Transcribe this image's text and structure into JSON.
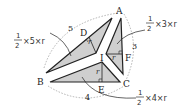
{
  "diagram": {
    "vertices": {
      "A": "A",
      "B": "B",
      "C": "C",
      "I": "I",
      "D": "D",
      "E": "E",
      "F": "F"
    },
    "sides": {
      "AB": "5",
      "AC": "3",
      "BC": "4"
    },
    "radius_label": "r",
    "formulas": {
      "ABI": {
        "num": "1",
        "den": "2",
        "rest": "×5×r"
      },
      "ACI": {
        "num": "1",
        "den": "2",
        "rest": "×3×r"
      },
      "BCI": {
        "num": "1",
        "den": "2",
        "rest": "×4×r"
      }
    },
    "colors": {
      "fill": "#cfcfcf",
      "stroke": "#222222",
      "dashed": "#999999"
    }
  }
}
